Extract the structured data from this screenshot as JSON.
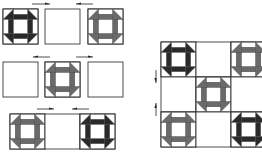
{
  "diagram": {
    "colors": {
      "background": "#ffffff",
      "outline": "#3a3a3a",
      "dark": "#2a2a2a",
      "medium": "#6a6a6a",
      "light": "#ffffff",
      "arrow": "#222222"
    },
    "block_types": {
      "dark": "churn-dash-dark",
      "medium": "churn-dash-medium",
      "plain": "plain-white"
    },
    "left_assembly": {
      "rows": [
        {
          "y": 9,
          "size": 35,
          "blocks": [
            {
              "x": 3,
              "type": "dark"
            },
            {
              "x": 45,
              "type": "plain"
            },
            {
              "x": 88,
              "type": "medium"
            }
          ],
          "arrows": [
            {
              "x1": 32,
              "x2": 50,
              "y": 4,
              "dir": "right"
            },
            {
              "x1": 76,
              "x2": 93,
              "y": 4,
              "dir": "left"
            }
          ]
        },
        {
          "y": 62,
          "size": 35,
          "blocks": [
            {
              "x": 3,
              "type": "plain"
            },
            {
              "x": 45,
              "type": "medium"
            },
            {
              "x": 88,
              "type": "plain"
            }
          ],
          "arrows": [
            {
              "x1": 33,
              "x2": 50,
              "y": 57,
              "dir": "left"
            },
            {
              "x1": 76,
              "x2": 93,
              "y": 57,
              "dir": "right"
            }
          ]
        },
        {
          "y": 114,
          "size": 35,
          "blocks": [
            {
              "x": 10,
              "type": "medium"
            },
            {
              "x": 45,
              "type": "plain"
            },
            {
              "x": 80,
              "type": "dark"
            }
          ],
          "arrows": [
            {
              "x1": 37,
              "x2": 54,
              "y": 109,
              "dir": "right"
            },
            {
              "x1": 72,
              "x2": 89,
              "y": 109,
              "dir": "left"
            }
          ]
        }
      ]
    },
    "right_assembly": {
      "x": 161,
      "y": 42,
      "size": 35,
      "grid": [
        [
          "dark",
          "plain",
          "medium"
        ],
        [
          "plain",
          "medium",
          "plain"
        ],
        [
          "medium",
          "plain",
          "dark"
        ]
      ],
      "arrows": [
        {
          "x": 156,
          "y1": 70,
          "y2": 83,
          "dir": "down"
        },
        {
          "x": 156,
          "y1": 103,
          "y2": 116,
          "dir": "up"
        }
      ]
    }
  }
}
